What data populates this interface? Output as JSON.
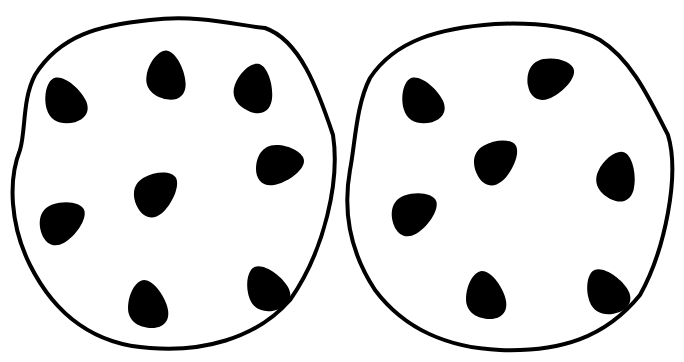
{
  "scene": {
    "description": "Two chocolate chip cookie outline drawings side by side",
    "background": "#ffffff",
    "ink": "#000000",
    "cookies": [
      {
        "name": "left-cookie",
        "chip_count": 8,
        "chips": [
          {
            "x": 65,
            "y": 100,
            "rot": -15
          },
          {
            "x": 167,
            "y": 75,
            "rot": 10
          },
          {
            "x": 255,
            "y": 88,
            "rot": 20
          },
          {
            "x": 280,
            "y": 165,
            "rot": 90
          },
          {
            "x": 157,
            "y": 193,
            "rot": 60
          },
          {
            "x": 63,
            "y": 222,
            "rot": 70
          },
          {
            "x": 148,
            "y": 304,
            "rot": 0
          },
          {
            "x": 267,
            "y": 288,
            "rot": -20
          }
        ]
      },
      {
        "name": "right-cookie",
        "chip_count": 7,
        "chips": [
          {
            "x": 422,
            "y": 100,
            "rot": -15
          },
          {
            "x": 551,
            "y": 78,
            "rot": 80
          },
          {
            "x": 618,
            "y": 176,
            "rot": 25
          },
          {
            "x": 497,
            "y": 161,
            "rot": 60
          },
          {
            "x": 415,
            "y": 213,
            "rot": 70
          },
          {
            "x": 486,
            "y": 295,
            "rot": 0
          },
          {
            "x": 607,
            "y": 291,
            "rot": -20
          }
        ]
      }
    ]
  }
}
